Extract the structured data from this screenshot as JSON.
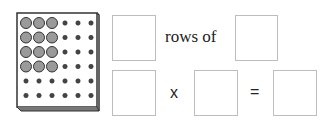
{
  "board": {
    "rows": 6,
    "columns": 6,
    "filled_rows": 4,
    "filled_columns": 3,
    "colors": {
      "frame": "#ffffff",
      "edge": "#333333",
      "peg": "#9a9a9a",
      "hole": "#444444"
    }
  },
  "sentence": {
    "rows_box": "",
    "connector": "rows of",
    "of_box": ""
  },
  "equation": {
    "factor1": "",
    "times": "x",
    "factor2": "",
    "equals": "=",
    "product": ""
  }
}
